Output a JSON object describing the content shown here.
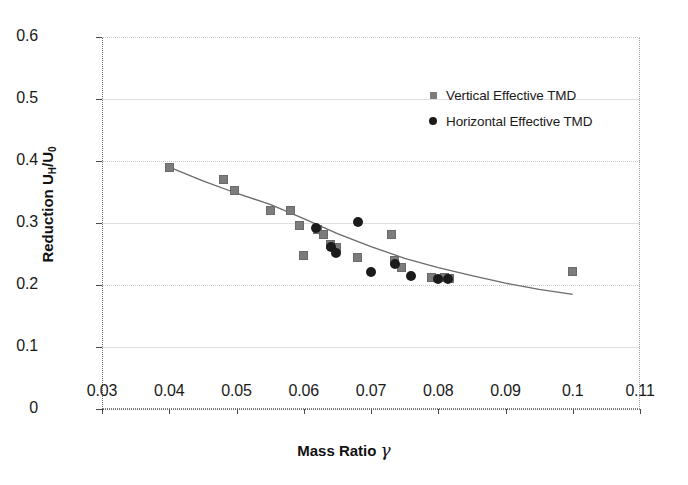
{
  "chart_data": {
    "type": "scatter",
    "title": "",
    "xlabel": "Mass Ratio γ",
    "ylabel": "Reduction U_H/U_0",
    "xlim": [
      0.03,
      0.11
    ],
    "ylim": [
      0.0,
      0.6
    ],
    "xticks": [
      "0.03",
      "0.04",
      "0.05",
      "0.06",
      "0.07",
      "0.08",
      "0.09",
      "0.1",
      "0.11"
    ],
    "xtick_values": [
      0.03,
      0.04,
      0.05,
      0.06,
      0.07,
      0.08,
      0.09,
      0.1,
      0.11
    ],
    "yticks": [
      "0",
      "0.1",
      "0.2",
      "0.3",
      "0.4",
      "0.5",
      "0.6"
    ],
    "ytick_values": [
      0,
      0.1,
      0.2,
      0.3,
      0.4,
      0.5,
      0.6
    ],
    "grid": true,
    "legend_position": "upper right",
    "series": [
      {
        "name": "Vertical Effective TMD",
        "marker": "square",
        "color": "#7c7c7c",
        "points": [
          [
            0.04,
            0.39
          ],
          [
            0.048,
            0.37
          ],
          [
            0.0497,
            0.352
          ],
          [
            0.055,
            0.32
          ],
          [
            0.058,
            0.32
          ],
          [
            0.0594,
            0.296
          ],
          [
            0.06,
            0.248
          ],
          [
            0.062,
            0.29
          ],
          [
            0.063,
            0.282
          ],
          [
            0.064,
            0.265
          ],
          [
            0.0648,
            0.26
          ],
          [
            0.068,
            0.245
          ],
          [
            0.073,
            0.281
          ],
          [
            0.0735,
            0.24
          ],
          [
            0.0745,
            0.228
          ],
          [
            0.079,
            0.212
          ],
          [
            0.081,
            0.212
          ],
          [
            0.0817,
            0.211
          ],
          [
            0.1,
            0.222
          ]
        ]
      },
      {
        "name": "Horizontal Effective TMD",
        "marker": "circle",
        "color": "#1b1b1b",
        "points": [
          [
            0.0618,
            0.292
          ],
          [
            0.064,
            0.262
          ],
          [
            0.0648,
            0.252
          ],
          [
            0.068,
            0.301
          ],
          [
            0.07,
            0.221
          ],
          [
            0.0735,
            0.234
          ],
          [
            0.076,
            0.215
          ],
          [
            0.08,
            0.21
          ],
          [
            0.0815,
            0.21
          ]
        ]
      }
    ],
    "trend_line": {
      "name": "fitted power trend",
      "color": "#6b6b6b",
      "points": [
        [
          0.04,
          0.39
        ],
        [
          0.045,
          0.368
        ],
        [
          0.05,
          0.348
        ],
        [
          0.055,
          0.33
        ],
        [
          0.06,
          0.307
        ],
        [
          0.065,
          0.283
        ],
        [
          0.07,
          0.262
        ],
        [
          0.075,
          0.243
        ],
        [
          0.08,
          0.228
        ],
        [
          0.085,
          0.215
        ],
        [
          0.09,
          0.203
        ],
        [
          0.095,
          0.193
        ],
        [
          0.1,
          0.185
        ]
      ]
    }
  },
  "legend": {
    "items": [
      {
        "label": "Vertical Effective TMD"
      },
      {
        "label": "Horizontal Effective TMD"
      }
    ]
  },
  "axes": {
    "x_title_text": "Mass Ratio",
    "x_title_symbol": "γ",
    "y_title_prefix": "Reduction U",
    "y_title_sub1": "H",
    "y_title_mid": "/U",
    "y_title_sub2": "0"
  }
}
